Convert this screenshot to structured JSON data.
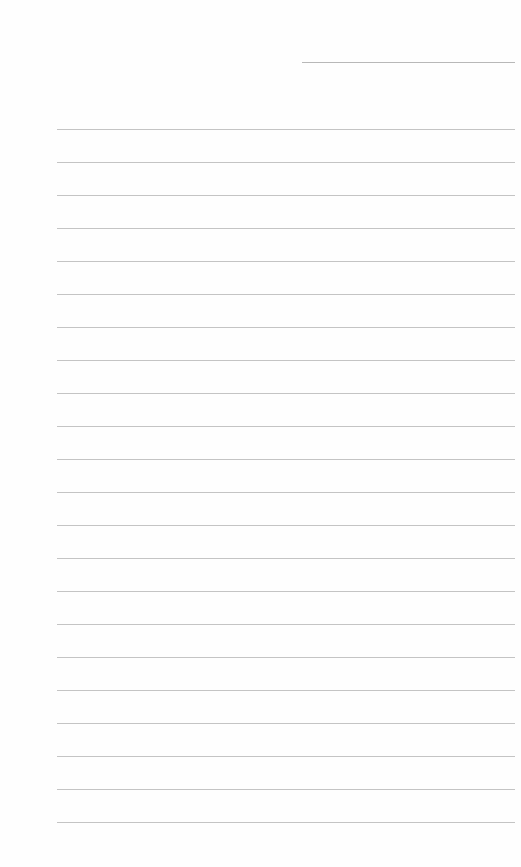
{
  "document": {
    "type": "lined-paper",
    "header_line": {
      "x": 302,
      "y": 62,
      "width": 213
    },
    "ruled_lines": {
      "count": 22,
      "start_y": 129,
      "spacing": 33,
      "left": 57,
      "width": 458
    },
    "line_color": "#c4c4c4",
    "background": "#ffffff"
  }
}
